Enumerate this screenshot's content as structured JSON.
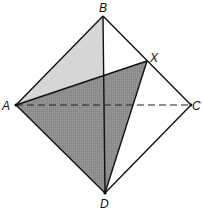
{
  "diagram": {
    "type": "tetrahedron-cross-section",
    "vertices": {
      "A": {
        "label": "A",
        "x": 16,
        "y": 105
      },
      "B": {
        "label": "B",
        "x": 103,
        "y": 16
      },
      "C": {
        "label": "C",
        "x": 191,
        "y": 105
      },
      "D": {
        "label": "D",
        "x": 105,
        "y": 193
      },
      "X": {
        "label": "X",
        "x": 147,
        "y": 61
      }
    },
    "edges_solid": [
      "AB",
      "BC",
      "CD",
      "DA",
      "BD",
      "AX",
      "XD"
    ],
    "edges_dashed": [
      "AC"
    ],
    "shaded_regions": [
      {
        "name": "face-ABD-upper",
        "shade": "light",
        "color": "#d4d4d4"
      },
      {
        "name": "plane-AXD",
        "shade": "dark",
        "color": "#8e8e8e"
      }
    ]
  }
}
